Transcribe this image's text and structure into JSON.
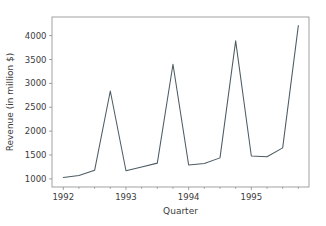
{
  "chart_data": {
    "type": "line",
    "title": "",
    "xlabel": "Quarter",
    "ylabel": "Revenue (in million $)",
    "x": [
      "1992 Q1",
      "1992 Q2",
      "1992 Q3",
      "1992 Q4",
      "1993 Q1",
      "1993 Q2",
      "1993 Q3",
      "1993 Q4",
      "1994 Q1",
      "1994 Q2",
      "1994 Q3",
      "1994 Q4",
      "1995 Q1",
      "1995 Q2",
      "1995 Q3",
      "1995 Q4"
    ],
    "x_numeric": [
      1992.0,
      1992.25,
      1992.5,
      1992.75,
      1993.0,
      1993.25,
      1993.5,
      1993.75,
      1994.0,
      1994.25,
      1994.5,
      1994.75,
      1995.0,
      1995.25,
      1995.5,
      1995.75
    ],
    "values": [
      1030,
      1070,
      1180,
      2840,
      1170,
      1250,
      1330,
      3400,
      1290,
      1320,
      1440,
      3890,
      1480,
      1465,
      1650,
      4210
    ],
    "series": [
      {
        "name": "Revenue",
        "color": "#4c5b63",
        "values": [
          1030,
          1070,
          1180,
          2840,
          1170,
          1250,
          1330,
          3400,
          1290,
          1320,
          1440,
          3890,
          1480,
          1465,
          1650,
          4210
        ]
      }
    ],
    "xlim": [
      1991.82,
      1995.92
    ],
    "ylim": [
      830,
      4390
    ],
    "xticks": [
      1992,
      1993,
      1994,
      1995
    ],
    "xtick_labels": [
      "1992",
      "1993",
      "1994",
      "1995"
    ],
    "yticks": [
      1000,
      1500,
      2000,
      2500,
      3000,
      3500,
      4000
    ],
    "ytick_labels": [
      "1000",
      "1500",
      "2000",
      "2500",
      "3000",
      "3500",
      "4000"
    ],
    "grid": false,
    "legend": false,
    "legend_position": "none",
    "line_color": "#4c5b63",
    "axis_color": "#8a8a8a",
    "background_color": "#ffffff"
  }
}
